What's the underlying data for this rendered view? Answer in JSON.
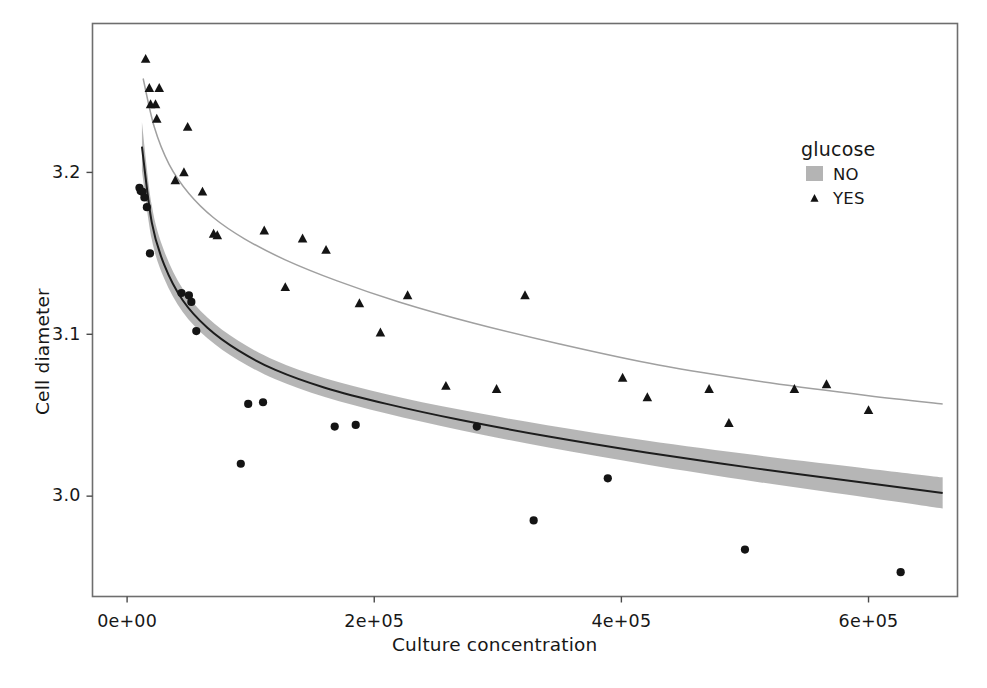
{
  "chart_data": {
    "type": "scatter",
    "title": "",
    "xlabel": "Culture concentration",
    "ylabel": "Cell diameter",
    "xlim": [
      -28000,
      672000
    ],
    "ylim": [
      2.938,
      3.292
    ],
    "xticks": [
      0,
      200000,
      400000,
      600000
    ],
    "xticklabels": [
      "0e+00",
      "2e+05",
      "4e+05",
      "6e+05"
    ],
    "yticks": [
      3.0,
      3.1,
      3.2
    ],
    "yticklabels": [
      "3.0",
      "3.1",
      "3.2"
    ],
    "grid": false,
    "legend": {
      "title": "glucose",
      "position": "top-right-inside",
      "entries": [
        {
          "label": "NO",
          "marker": "circle-with-line",
          "key_style": "gray-box",
          "color": "#1c1c1c",
          "band_color": "#b4b4b4"
        },
        {
          "label": "YES",
          "marker": "triangle",
          "key_style": "plain",
          "color": "#1c1c1c",
          "band_color": "#e8e8e8"
        }
      ]
    },
    "series": [
      {
        "name": "NO",
        "marker": "circle",
        "color": "#141414",
        "fit_line_color": "#1c1c1c",
        "ribbon_color": "#b0b0b0",
        "points": [
          [
            10000,
            3.1905
          ],
          [
            11000,
            3.1885
          ],
          [
            12500,
            3.188
          ],
          [
            14000,
            3.1845
          ],
          [
            16000,
            3.1785
          ],
          [
            18500,
            3.15
          ],
          [
            44000,
            3.1255
          ],
          [
            50000,
            3.124
          ],
          [
            52000,
            3.12
          ],
          [
            56000,
            3.102
          ],
          [
            110000,
            3.058
          ],
          [
            98000,
            3.057
          ],
          [
            92000,
            3.02
          ],
          [
            168000,
            3.043
          ],
          [
            185000,
            3.044
          ],
          [
            283000,
            3.043
          ],
          [
            329000,
            2.985
          ],
          [
            389000,
            3.011
          ],
          [
            500000,
            2.967
          ],
          [
            626000,
            2.953
          ]
        ],
        "fit_curve": [
          [
            12000,
            3.216
          ],
          [
            20000,
            3.169
          ],
          [
            30000,
            3.143
          ],
          [
            45000,
            3.121
          ],
          [
            65000,
            3.104
          ],
          [
            90000,
            3.09
          ],
          [
            120000,
            3.078
          ],
          [
            160000,
            3.067
          ],
          [
            210000,
            3.057
          ],
          [
            270000,
            3.047
          ],
          [
            340000,
            3.037
          ],
          [
            420000,
            3.027
          ],
          [
            510000,
            3.017
          ],
          [
            600000,
            3.008
          ],
          [
            660000,
            3.002
          ]
        ],
        "ribbon_halfwidth": [
          0.015,
          0.0105,
          0.0085,
          0.0072,
          0.0064,
          0.006,
          0.0058,
          0.0058,
          0.006,
          0.0063,
          0.0068,
          0.0074,
          0.0082,
          0.009,
          0.0096
        ]
      },
      {
        "name": "YES",
        "marker": "triangle",
        "color": "#141414",
        "fit_line_color": "#9a9a9a",
        "points": [
          [
            15000,
            3.27
          ],
          [
            18000,
            3.252
          ],
          [
            26000,
            3.252
          ],
          [
            19000,
            3.242
          ],
          [
            23000,
            3.242
          ],
          [
            24000,
            3.233
          ],
          [
            49000,
            3.228
          ],
          [
            46000,
            3.2
          ],
          [
            39000,
            3.195
          ],
          [
            61000,
            3.188
          ],
          [
            70000,
            3.162
          ],
          [
            73000,
            3.161
          ],
          [
            111000,
            3.164
          ],
          [
            142000,
            3.159
          ],
          [
            161000,
            3.152
          ],
          [
            128000,
            3.129
          ],
          [
            188000,
            3.119
          ],
          [
            205000,
            3.101
          ],
          [
            227000,
            3.124
          ],
          [
            258000,
            3.068
          ],
          [
            299000,
            3.066
          ],
          [
            322000,
            3.124
          ],
          [
            401000,
            3.073
          ],
          [
            421000,
            3.061
          ],
          [
            471000,
            3.066
          ],
          [
            487000,
            3.045
          ],
          [
            540000,
            3.066
          ],
          [
            566000,
            3.069
          ],
          [
            600000,
            3.053
          ]
        ],
        "fit_curve": [
          [
            13000,
            3.258
          ],
          [
            22000,
            3.228
          ],
          [
            34000,
            3.205
          ],
          [
            50000,
            3.187
          ],
          [
            70000,
            3.172
          ],
          [
            95000,
            3.159
          ],
          [
            128000,
            3.146
          ],
          [
            170000,
            3.133
          ],
          [
            220000,
            3.12
          ],
          [
            280000,
            3.107
          ],
          [
            350000,
            3.094
          ],
          [
            430000,
            3.081
          ],
          [
            520000,
            3.07
          ],
          [
            600000,
            3.062
          ],
          [
            660000,
            3.057
          ]
        ]
      }
    ]
  },
  "axes": {
    "x_tick_labels": [
      "0e+00",
      "2e+05",
      "4e+05",
      "6e+05"
    ],
    "y_tick_labels": [
      "3.2",
      "3.1",
      "3.0"
    ],
    "x_title": "Culture concentration",
    "y_title": "Cell diameter"
  },
  "legend": {
    "title": "glucose",
    "items": [
      {
        "label": "NO"
      },
      {
        "label": "YES"
      }
    ]
  },
  "caption": {
    "cut_off_text": ""
  }
}
